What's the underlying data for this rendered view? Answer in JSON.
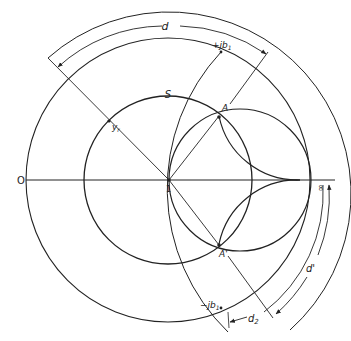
{
  "diagram": {
    "type": "admittance-chart-construction",
    "labels": {
      "d": "d",
      "plus_jb1": "+jb",
      "plus_jb1_sub": "1",
      "S": "S",
      "A": "A",
      "A_prime": "A'",
      "y_r": "y",
      "y_r_sub": "r",
      "O": "O",
      "one": "1",
      "B": "∞",
      "minus_jb1": "−jb",
      "minus_jb1_sub": "1",
      "d2": "d",
      "d2_sub": "2",
      "d_prime": "d'"
    },
    "colors": {
      "ink": "#222222",
      "background": "#ffffff"
    }
  }
}
